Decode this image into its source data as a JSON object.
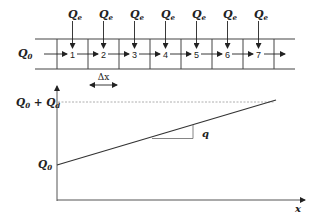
{
  "diagram": {
    "type": "channel-with-lateral-inflow",
    "inflow_label": "Q",
    "inflow_sub": "0",
    "lateral_label": "Q",
    "lateral_sub": "e",
    "cells": [
      "1",
      "2",
      "3",
      "4",
      "5",
      "6",
      "7"
    ],
    "spacing_label": "Δx"
  },
  "graph": {
    "y_top_label_main": "Q",
    "y_top_label_sub1": "0",
    "y_top_label_plus": " + ",
    "y_top_label_main2": "Q",
    "y_top_label_sub2": "d",
    "y_bottom_label_main": "Q",
    "y_bottom_label_sub": "0",
    "slope_label": "q",
    "x_axis_label": "x"
  },
  "colors": {
    "line": "#333333",
    "dashed": "#888888",
    "background": "#ffffff"
  }
}
